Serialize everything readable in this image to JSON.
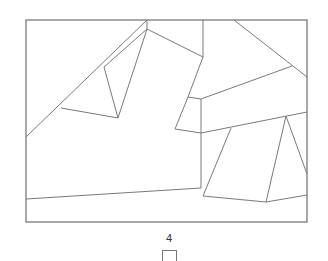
{
  "diagram": {
    "stroke_color": "#7a7a7a",
    "frame": {
      "x1": 26,
      "y1": 20,
      "x2": 307,
      "y2": 222
    },
    "segments": [
      [
        26,
        137,
        147,
        20
      ],
      [
        104,
        67,
        147,
        29
      ],
      [
        147,
        20,
        147,
        29
      ],
      [
        61,
        108,
        118,
        118
      ],
      [
        104,
        67,
        118,
        118
      ],
      [
        147,
        29,
        118,
        118
      ],
      [
        147,
        29,
        203,
        57
      ],
      [
        203,
        20,
        203,
        57
      ],
      [
        203,
        57,
        188,
        97
      ],
      [
        188,
        97,
        201,
        99
      ],
      [
        188,
        97,
        175,
        129
      ],
      [
        175,
        129,
        201,
        133
      ],
      [
        201,
        99,
        292,
        66
      ],
      [
        234,
        20,
        307,
        77
      ],
      [
        201,
        99,
        201,
        188
      ],
      [
        201,
        133,
        307,
        112
      ],
      [
        26,
        199,
        201,
        188
      ],
      [
        231,
        128,
        203,
        196
      ],
      [
        286,
        116,
        266,
        202
      ],
      [
        286,
        116,
        307,
        174
      ],
      [
        203,
        196,
        266,
        202
      ],
      [
        266,
        202,
        307,
        195
      ]
    ]
  },
  "footer": {
    "page_number": "4"
  }
}
